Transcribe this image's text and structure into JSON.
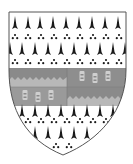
{
  "image": {
    "subject": "heraldic coat of arms",
    "description": "Ermine shield with a fess per pale, wavy and charged"
  },
  "shield": {
    "field": "ermine",
    "field_color": "#ffffff",
    "spot_color": "#1a1a1a",
    "outline_color": "#555555"
  },
  "fess": {
    "left_upper_color": "#8a8a8a",
    "left_lower_color": "#9a9a9a",
    "right_upper_color": "#8e8e8e",
    "right_lower_color": "#8a8a8a",
    "wavy_color": "#b8b8b8",
    "charge_color": "#cfcfcf",
    "charges_upper_right": 3,
    "charges_lower_left": 3
  }
}
